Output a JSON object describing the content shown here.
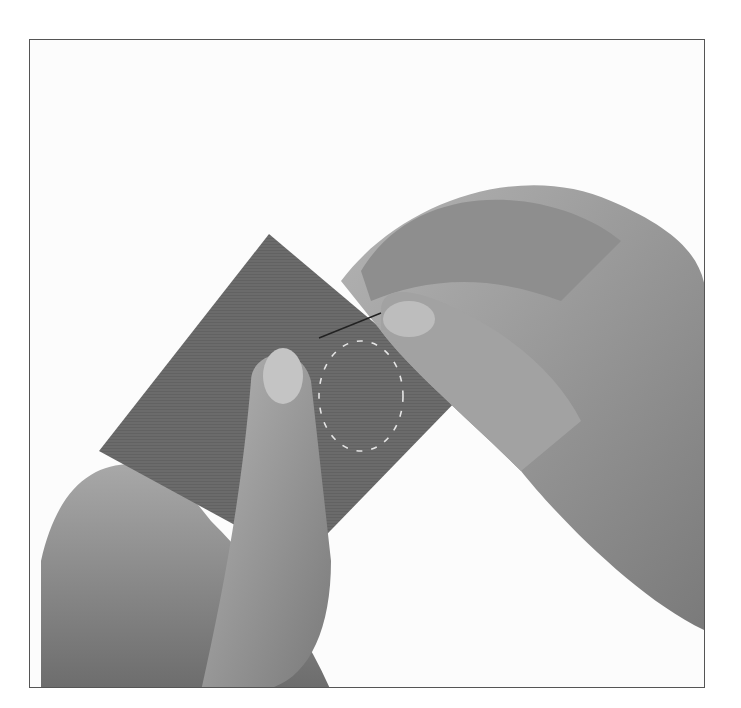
{
  "image": {
    "description": "Black-and-white photograph of two hands hand-sewing a running stitch around a circle on a square of fabric with a needle",
    "subjects": [
      "left-hand",
      "right-hand",
      "fabric-square",
      "needle",
      "running-stitch-circle"
    ],
    "colors": {
      "background": "#fcfcfc",
      "frame": "#555555",
      "fabric": "#6b6b6b",
      "skin": "#9a9a9a",
      "skin_shadow": "#6e6e6e",
      "stitch": "#e6e6e6"
    }
  }
}
